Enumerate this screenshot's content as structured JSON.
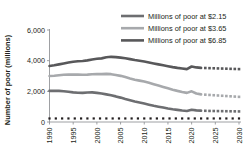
{
  "chart_data": {
    "type": "line",
    "title": "",
    "xlabel": "",
    "ylabel": "Number of poor (millions)",
    "xlim": [
      1990,
      2030
    ],
    "ylim": [
      0,
      6000
    ],
    "grid": false,
    "legend_position": "top-right",
    "xticks": [
      "1990",
      "1995",
      "2000",
      "2005",
      "2010",
      "2015",
      "2020",
      "2025",
      "2030"
    ],
    "yticks": [
      "0",
      "2,000",
      "4,000",
      "6,000"
    ],
    "x": [
      1990,
      1991,
      1992,
      1993,
      1994,
      1995,
      1996,
      1997,
      1998,
      1999,
      2000,
      2001,
      2002,
      2003,
      2004,
      2005,
      2006,
      2007,
      2008,
      2009,
      2010,
      2011,
      2012,
      2013,
      2014,
      2015,
      2016,
      2017,
      2018,
      2019,
      2020,
      2021,
      2022
    ],
    "x_projected": [
      2022,
      2023,
      2024,
      2025,
      2026,
      2027,
      2028,
      2029,
      2030
    ],
    "series": [
      {
        "name": "Millions of poor at $6.85",
        "color": "#58585a",
        "style": "solid",
        "values": [
          3650,
          3700,
          3760,
          3820,
          3880,
          3930,
          3960,
          3980,
          4020,
          4080,
          4120,
          4150,
          4220,
          4250,
          4230,
          4200,
          4160,
          4100,
          4040,
          3990,
          3940,
          3880,
          3820,
          3760,
          3700,
          3640,
          3580,
          3530,
          3490,
          3450,
          3620,
          3560,
          3530
        ],
        "projected": [
          3530,
          3520,
          3510,
          3500,
          3490,
          3480,
          3470,
          3460,
          3450
        ]
      },
      {
        "name": "Millions of poor at $3.65",
        "color": "#a7a9ac",
        "style": "solid",
        "values": [
          3000,
          3020,
          3050,
          3080,
          3090,
          3100,
          3090,
          3080,
          3090,
          3110,
          3130,
          3120,
          3140,
          3120,
          3070,
          3010,
          2930,
          2840,
          2760,
          2700,
          2640,
          2560,
          2470,
          2380,
          2290,
          2200,
          2110,
          2030,
          1960,
          1900,
          2000,
          1860,
          1800
        ],
        "projected": [
          1800,
          1780,
          1760,
          1740,
          1720,
          1700,
          1680,
          1660,
          1640
        ]
      },
      {
        "name": "Millions of poor at $2.15",
        "color": "#6d6e71",
        "style": "solid",
        "values": [
          2030,
          2040,
          2030,
          2010,
          1970,
          1930,
          1910,
          1900,
          1920,
          1930,
          1900,
          1860,
          1800,
          1740,
          1670,
          1590,
          1500,
          1420,
          1340,
          1270,
          1200,
          1130,
          1060,
          1000,
          940,
          880,
          830,
          790,
          750,
          720,
          800,
          760,
          740
        ],
        "projected": [
          740,
          730,
          720,
          715,
          710,
          705,
          700,
          695,
          690
        ]
      },
      {
        "name": "baseline",
        "color": "#231f20",
        "style": "dotted",
        "values": [
          230,
          230,
          230,
          230,
          230,
          230,
          230,
          230,
          230,
          230,
          230,
          230,
          230,
          230,
          230,
          230,
          230,
          230,
          230,
          230,
          230,
          230,
          230,
          230,
          230,
          230,
          230,
          230,
          230,
          230,
          230,
          230,
          230
        ],
        "projected": [
          230,
          230,
          230,
          230,
          230,
          230,
          230,
          230,
          230
        ]
      }
    ]
  },
  "legend": {
    "items": [
      {
        "label": "Millions of poor at $2.15",
        "color": "#6d6e71"
      },
      {
        "label": "Millions of poor at $3.65",
        "color": "#a7a9ac"
      },
      {
        "label": "Millions of poor at $6.85",
        "color": "#58585a"
      }
    ]
  },
  "axis": {
    "ylabel": "Number of poor (millions)",
    "yticks": [
      "6,000",
      "4,000",
      "2,000",
      "0"
    ],
    "xticks": [
      "1990",
      "1995",
      "2000",
      "2005",
      "2010",
      "2015",
      "2020",
      "2025",
      "2030"
    ]
  }
}
